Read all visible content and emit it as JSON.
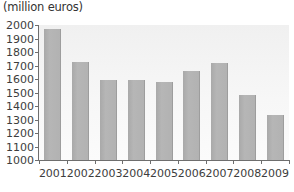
{
  "chart_data": {
    "type": "bar",
    "title": "(million euros)",
    "xlabel": "",
    "ylabel": "",
    "categories": [
      "2001",
      "2002",
      "2003",
      "2004",
      "2005",
      "2006",
      "2007",
      "2008",
      "2009"
    ],
    "values": [
      1970,
      1725,
      1595,
      1590,
      1580,
      1660,
      1715,
      1480,
      1335
    ],
    "ylim": [
      1000,
      2000
    ],
    "yticks": [
      1000,
      1100,
      1200,
      1300,
      1400,
      1500,
      1600,
      1700,
      1800,
      1900,
      2000
    ],
    "ytick_labels": [
      "1000",
      "1100",
      "1200",
      "1300",
      "1400",
      "1500",
      "1600",
      "1700",
      "1800",
      "1900",
      "2000"
    ],
    "grid": false,
    "legend": null,
    "series": [
      {
        "name": "value",
        "values": [
          1970,
          1725,
          1595,
          1590,
          1580,
          1660,
          1715,
          1480,
          1335
        ]
      }
    ],
    "colors": {
      "bar": "#b2b2b2",
      "bar_edge": "#9d9d9d",
      "axis": "#6e6e6e",
      "plot_background": "#f4f4f4",
      "text": "#3d3d3d",
      "page_background": "#ffffff"
    }
  }
}
